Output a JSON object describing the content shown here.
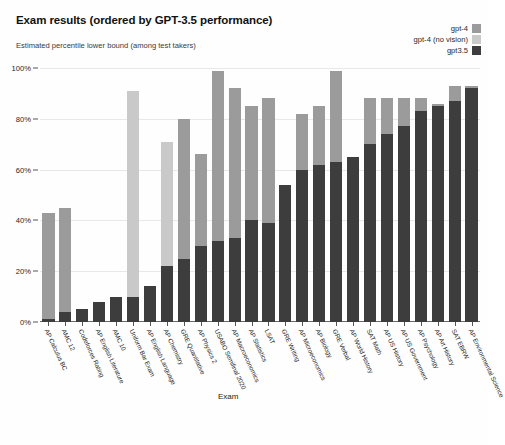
{
  "header": {
    "title": "Exam results (ordered by GPT-3.5 performance)",
    "subtitle": "Estimated percentile lower bound (among test takers)"
  },
  "legend": {
    "position": "top-right",
    "entries": [
      {
        "label": "gpt-4",
        "color": "#9b9b9b"
      },
      {
        "label": "gpt-4 (no vision)",
        "color": "#c9c9c9"
      },
      {
        "label": "gpt3.5",
        "color": "#3d3d3d"
      }
    ]
  },
  "chart_data": {
    "type": "bar",
    "title": "Exam results (ordered by GPT-3.5 performance)",
    "subtitle": "Estimated percentile lower bound (among test takers)",
    "xlabel": "Exam",
    "ylabel": "",
    "ylim": [
      0,
      100
    ],
    "yticks": [
      "0%",
      "20%",
      "40%",
      "60%",
      "80%",
      "100%"
    ],
    "ytick_values": [
      0,
      20,
      40,
      60,
      80,
      100
    ],
    "grid": true,
    "stacked": true,
    "bar_mode": "overlay-stacked",
    "categories": [
      "AP Calculus BC",
      "AMC 12",
      "Codeforces Rating",
      "AP English Literature",
      "AMC 10",
      "Uniform Bar Exam",
      "AP English Language",
      "AP Chemistry",
      "GRE Quantitative",
      "AP Physics 2",
      "USABO Semifinal 2020",
      "AP Macroeconomics",
      "AP Statistics",
      "LSAT",
      "GRE Writing",
      "AP Microeconomics",
      "AP Biology",
      "GRE Verbal",
      "AP World History",
      "SAT Math",
      "AP US History",
      "AP US Government",
      "AP Psychology",
      "AP Art History",
      "SAT EBRW",
      "AP Environmental Science"
    ],
    "series": [
      {
        "name": "gpt3.5",
        "color": "#3d3d3d",
        "values": [
          1,
          4,
          5,
          8,
          10,
          10,
          14,
          22,
          25,
          30,
          32,
          33,
          40,
          39,
          54,
          60,
          62,
          63,
          65,
          70,
          74,
          77,
          83,
          85,
          87,
          92
        ]
      },
      {
        "name": "gpt-4",
        "color": "#9b9b9b",
        "values": [
          43,
          45,
          5,
          8,
          10,
          10,
          14,
          22,
          80,
          66,
          99,
          92,
          85,
          88,
          54,
          82,
          85,
          99,
          65,
          88,
          88,
          88,
          88,
          86,
          93,
          93
        ]
      },
      {
        "name": "gpt-4 (no vision)",
        "color": "#c9c9c9",
        "values": [
          43,
          45,
          5,
          8,
          10,
          91,
          14,
          71,
          80,
          66,
          99,
          92,
          85,
          88,
          54,
          82,
          85,
          99,
          65,
          88,
          88,
          88,
          88,
          86,
          93,
          93
        ]
      }
    ]
  }
}
